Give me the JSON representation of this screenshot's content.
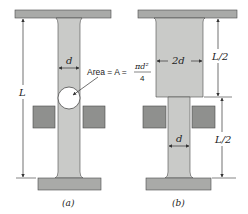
{
  "figure": {
    "panels": [
      {
        "id": "a",
        "caption": "(a)",
        "width_label": "d",
        "length_label": "L",
        "area_annotation": {
          "prefix": "Area = A =",
          "numerator": "πd²",
          "denominator": "4"
        }
      },
      {
        "id": "b",
        "caption": "(b)",
        "wide_width_label": "2d",
        "narrow_width_label": "d",
        "upper_length_label": "L/2",
        "lower_length_label": "L/2"
      }
    ],
    "colors": {
      "plate": "#a9aaa8",
      "column": "#c9cac8",
      "grip": "#8f908e",
      "outline": "#4a4a4a",
      "line": "#333333",
      "background": "#ffffff"
    }
  }
}
